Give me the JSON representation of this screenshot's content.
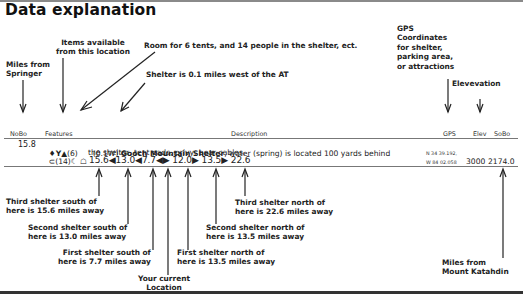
{
  "title": "Data explanation",
  "annotations": {
    "miles_from_springer": "Miles from\nSpringer",
    "items_available": "Items available\nfrom this location",
    "room_for_tents": "Room for 6 tents, and 14 people in the shelter, ect.",
    "shelter_west": "Shelter is 0.1 miles west of the AT",
    "gps_coordinates": "GPS\nCoordinates\nfor shelter,\nparking area,\nor attractions",
    "elevation": "Elevevation",
    "third_south": "Third shelter south of\nhere is 15.6 miles away",
    "second_south": "Second shelter south of\nhere is 13.0 miles away",
    "first_south": "First shelter south of\nhere is 7.7 miles away",
    "current_location": "Your current\nLocation",
    "first_north": "First shelter north of\nhere is 13.5 miles away",
    "second_north": "Second shelter north of\nhere is 13.5 miles away",
    "third_north": "Third shelter north of\nhere is 22.6 miles away",
    "miles_from_katahdin": "Miles from\nMount Katahdin"
  },
  "table": {
    "headers": {
      "nobo": "NoBo",
      "features": "Features",
      "description": "Description",
      "gps": "GPS",
      "elev": "Elev",
      "sobo": "SoBo"
    },
    "row": {
      "nobo": "15.8",
      "feature_icons_line1": "♦Y▲",
      "tent_count": "(6)",
      "feature_icons_line2_prefix": "⊂",
      "shelter_capacity": "(14)",
      "feature_icons_line2_suffix": "☾ ☖",
      "offset": "(0.1W)",
      "name": "Gooch Mountain Shelter",
      "desc_line1": ", water (spring) is located 100 yards behind",
      "desc_line2": "the shelter, tent pads, privy, bear cables.",
      "distances": "15.6◀13.0◀7.7◀▶ 12.0▶ 13.5▶ 22.6",
      "gps_line1": "N 34 39.192,",
      "gps_line2": "W 84 02.058",
      "elev": "3000",
      "sobo": "2174.0"
    }
  }
}
